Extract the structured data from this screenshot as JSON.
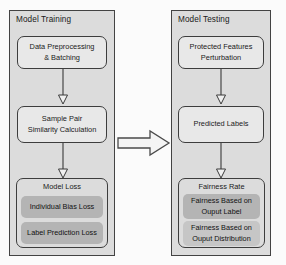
{
  "diagram": {
    "background_color": "#fbfbfb",
    "panel_fill_color": "#dcdcdc",
    "panel_border_color": "#434343",
    "node_fill_color": "#e8e8e8",
    "subbox_dark_color": "#b4b4b4",
    "subbox_light_color": "#c6c6c6"
  },
  "panels": {
    "training": {
      "title": "Model Training",
      "nodes": {
        "preprocessing": "Data Preprocessing\n& Batching",
        "similarity": "Sample Pair\nSimilarity Calculation",
        "model_loss": {
          "title": "Model Loss",
          "items": [
            "Individual Bias Loss",
            "Label Prediction Loss"
          ]
        }
      }
    },
    "testing": {
      "title": "Model Testing",
      "nodes": {
        "perturbation": "Protected Features\nPerturbation",
        "predicted_labels": "Predicted Labels",
        "fairness_rate": {
          "title": "Fairness Rate",
          "items": [
            "Fairness Based on\nOuput Label",
            "Fairness Based on\nOuput Distribution"
          ]
        }
      }
    }
  },
  "connectors": {
    "training_flow_1": "arrow-down",
    "training_flow_2": "arrow-down",
    "testing_flow_1": "arrow-down",
    "testing_flow_2": "arrow-down",
    "training_to_testing": "block-arrow-right"
  }
}
